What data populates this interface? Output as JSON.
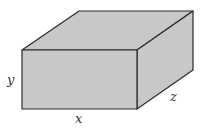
{
  "diagram": {
    "type": "rectangular-box",
    "labels": {
      "width": "x",
      "height": "y",
      "depth": "z"
    },
    "colors": {
      "fill": "#c8c8c8",
      "stroke": "#2a2a2a",
      "label": "#333333"
    },
    "geometry": {
      "front": [
        [
          22,
          50
        ],
        [
          137,
          50
        ],
        [
          137,
          109
        ],
        [
          22,
          109
        ]
      ],
      "top": [
        [
          22,
          50
        ],
        [
          79,
          11
        ],
        [
          193,
          11
        ],
        [
          137,
          50
        ]
      ],
      "right": [
        [
          137,
          50
        ],
        [
          193,
          11
        ],
        [
          193,
          70
        ],
        [
          137,
          109
        ]
      ]
    }
  }
}
